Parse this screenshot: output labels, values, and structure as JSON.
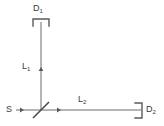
{
  "figure": {
    "type": "optical-interferometer-schematic",
    "background_color": "#ffffff",
    "line_color": "#606060",
    "text_color": "#3a3a3a",
    "width": 164,
    "height": 126
  },
  "labels": {
    "source": "S",
    "detector_1": "D",
    "detector_1_sub": "1",
    "detector_2": "D",
    "detector_2_sub": "2",
    "arm_1": "L",
    "arm_1_sub": "1",
    "arm_2": "L",
    "arm_2_sub": "2"
  },
  "components": {
    "source_name": "source",
    "beamsplitter_name": "beamsplitter",
    "detector_1_name": "detector-1",
    "detector_2_name": "detector-2",
    "vertical_arm_name": "vertical-beam-arm",
    "horizontal_arm_name": "horizontal-beam-arm"
  },
  "geometry": {
    "beamsplitter_x": 41,
    "beam_y": 110,
    "detector_1_y": 20,
    "detector_2_x": 141,
    "source_x": 16
  }
}
